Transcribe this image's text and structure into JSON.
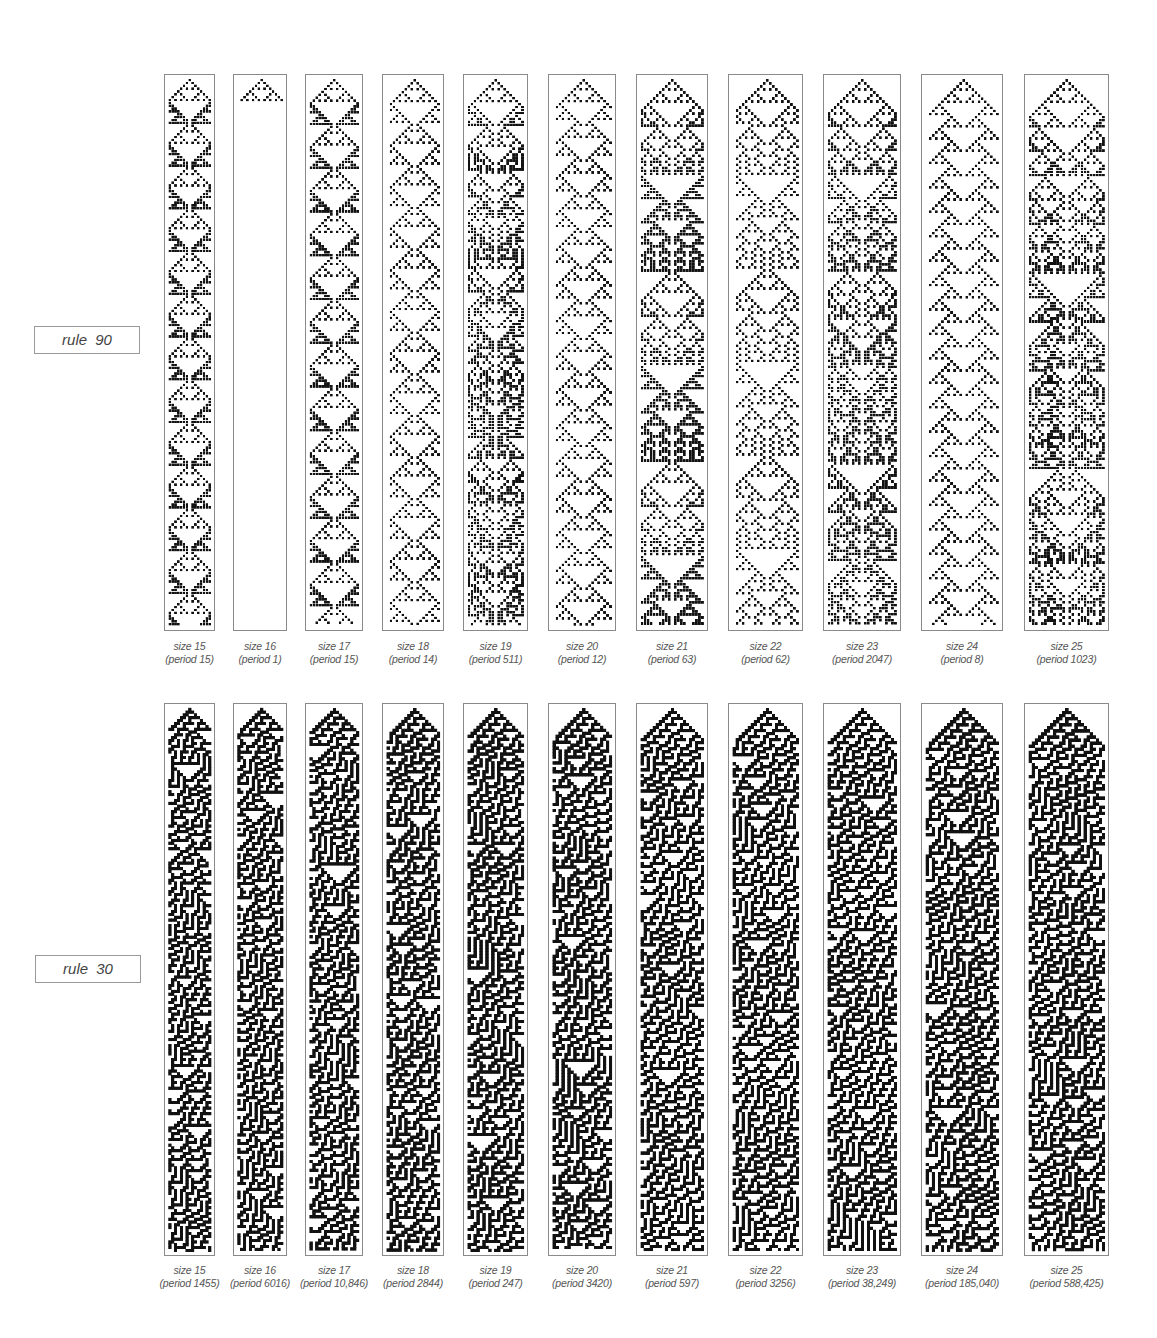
{
  "figure": {
    "rows": [
      {
        "id": "rule90",
        "label": "rule 90",
        "rule": 90,
        "label_box": {
          "x": 34,
          "y": 326,
          "w": 104,
          "h": 26
        },
        "top": 74,
        "bottom": 631,
        "caption_y": 640,
        "panels": [
          {
            "size": 15,
            "size_label": "size 15",
            "period_label": "(period 15)",
            "x": 164,
            "w": 51
          },
          {
            "size": 16,
            "size_label": "size 16",
            "period_label": "(period 1)",
            "x": 233,
            "w": 54
          },
          {
            "size": 17,
            "size_label": "size 17",
            "period_label": "(period 15)",
            "x": 305,
            "w": 58
          },
          {
            "size": 18,
            "size_label": "size 18",
            "period_label": "(period 14)",
            "x": 382,
            "w": 62
          },
          {
            "size": 19,
            "size_label": "size 19",
            "period_label": "(period 511)",
            "x": 463,
            "w": 65
          },
          {
            "size": 20,
            "size_label": "size 20",
            "period_label": "(period 12)",
            "x": 548,
            "w": 68
          },
          {
            "size": 21,
            "size_label": "size 21",
            "period_label": "(period 63)",
            "x": 636,
            "w": 72
          },
          {
            "size": 22,
            "size_label": "size 22",
            "period_label": "(period 62)",
            "x": 728,
            "w": 75
          },
          {
            "size": 23,
            "size_label": "size 23",
            "period_label": "(period 2047)",
            "x": 823,
            "w": 78
          },
          {
            "size": 24,
            "size_label": "size 24",
            "period_label": "(period 8)",
            "x": 921,
            "w": 82
          },
          {
            "size": 25,
            "size_label": "size 25",
            "period_label": "(period 1023)",
            "x": 1024,
            "w": 85
          }
        ]
      },
      {
        "id": "rule30",
        "label": "rule 30",
        "rule": 30,
        "label_box": {
          "x": 35,
          "y": 955,
          "w": 104,
          "h": 26
        },
        "top": 703,
        "bottom": 1256,
        "caption_y": 1264,
        "panels": [
          {
            "size": 15,
            "size_label": "size 15",
            "period_label": "(period 1455)",
            "x": 164,
            "w": 51
          },
          {
            "size": 16,
            "size_label": "size 16",
            "period_label": "(period 6016)",
            "x": 233,
            "w": 54
          },
          {
            "size": 17,
            "size_label": "size 17",
            "period_label": "(period 10,846)",
            "x": 305,
            "w": 58
          },
          {
            "size": 18,
            "size_label": "size 18",
            "period_label": "(period 2844)",
            "x": 382,
            "w": 62
          },
          {
            "size": 19,
            "size_label": "size 19",
            "period_label": "(period 247)",
            "x": 463,
            "w": 65
          },
          {
            "size": 20,
            "size_label": "size 20",
            "period_label": "(period 3420)",
            "x": 548,
            "w": 68
          },
          {
            "size": 21,
            "size_label": "size 21",
            "period_label": "(period 597)",
            "x": 636,
            "w": 72
          },
          {
            "size": 22,
            "size_label": "size 22",
            "period_label": "(period 3256)",
            "x": 728,
            "w": 75
          },
          {
            "size": 23,
            "size_label": "size 23",
            "period_label": "(period 38,249)",
            "x": 823,
            "w": 78
          },
          {
            "size": 24,
            "size_label": "size 24",
            "period_label": "(period 185,040)",
            "x": 921,
            "w": 82
          },
          {
            "size": 25,
            "size_label": "size 25",
            "period_label": "(period 588,425)",
            "x": 1024,
            "w": 85
          }
        ]
      }
    ],
    "colors": {
      "cell_on": "#111111",
      "cell_off": "#ffffff",
      "border": "#8a8a8a"
    }
  }
}
